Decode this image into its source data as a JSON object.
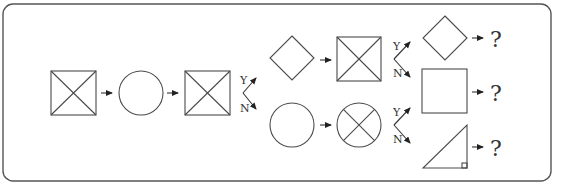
{
  "diagram": {
    "type": "shape-sequence-flowchart",
    "colors": {
      "stroke": "#4a4a4a",
      "frame": "#555555",
      "background": "#ffffff"
    },
    "labels": {
      "yes": "Y",
      "no": "N",
      "unknown": "?"
    },
    "main_sequence": [
      {
        "id": "n1",
        "shape": "square-with-diagonals"
      },
      {
        "id": "n2",
        "shape": "circle"
      },
      {
        "id": "n3",
        "shape": "square-with-diagonals"
      }
    ],
    "branch_1": {
      "yes": [
        {
          "id": "y1",
          "shape": "diamond"
        },
        {
          "id": "y2",
          "shape": "square-with-diagonals"
        }
      ],
      "no": [
        {
          "id": "n_1",
          "shape": "circle"
        },
        {
          "id": "n_2",
          "shape": "circle-with-diagonals"
        }
      ]
    },
    "branch_2": {
      "yes": {
        "shape": "diamond",
        "result": "?"
      },
      "no": {
        "shape": "square",
        "result": "?"
      }
    },
    "branch_3": {
      "yes": {
        "shape": "square",
        "result": "?"
      },
      "no": {
        "shape": "right-triangle",
        "result": "?"
      }
    }
  }
}
